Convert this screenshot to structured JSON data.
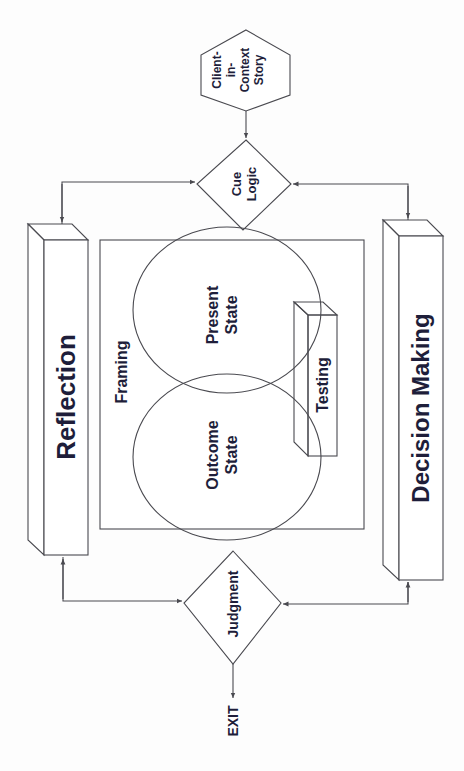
{
  "diagram": {
    "orientation": "rotated 90deg counter-clockwise",
    "nodes": {
      "client_story": {
        "line1": "Client-",
        "line2": "in-",
        "line3": "Context",
        "line4": "Story"
      },
      "cue_logic": {
        "line1": "Cue",
        "line2": "Logic"
      },
      "reflection": {
        "label": "Reflection"
      },
      "decision_making": {
        "label": "Decision Making"
      },
      "framing": {
        "label": "Framing"
      },
      "present_state": {
        "line1": "Present",
        "line2": "State"
      },
      "outcome_state": {
        "line1": "Outcome",
        "line2": "State"
      },
      "testing": {
        "label": "Testing"
      },
      "judgment": {
        "label": "Judgment"
      },
      "exit": {
        "label": "EXIT"
      }
    },
    "colors": {
      "line": "#4a4a50",
      "text": "#1e1e3a",
      "background": "#fdfdfd"
    }
  }
}
